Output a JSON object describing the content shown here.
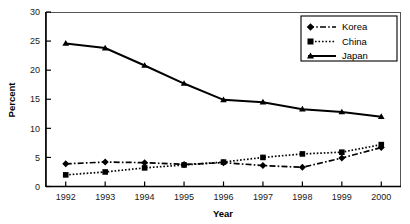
{
  "chart_data": {
    "type": "line",
    "title": "",
    "xlabel": "Year",
    "ylabel": "Percent",
    "categories": [
      1992,
      1993,
      1994,
      1995,
      1996,
      1997,
      1998,
      1999,
      2000
    ],
    "x_tick_labels": [
      "1992",
      "1993",
      "1994",
      "1995",
      "1996",
      "1997",
      "1998",
      "1999",
      "2000"
    ],
    "y_tick_labels": [
      "0",
      "5",
      "10",
      "15",
      "20",
      "25",
      "30"
    ],
    "y_ticks": [
      0,
      5,
      10,
      15,
      20,
      25,
      30
    ],
    "ylim": [
      0,
      30
    ],
    "xlim": [
      1992,
      2000
    ],
    "grid": false,
    "legend_position": "top-right",
    "series": [
      {
        "name": "Korea",
        "marker": "diamond",
        "linestyle": "dash-dot",
        "color": "#000000",
        "values": [
          3.9,
          4.2,
          4.1,
          3.8,
          4.1,
          3.6,
          3.3,
          4.9,
          6.7
        ]
      },
      {
        "name": "China",
        "marker": "square",
        "linestyle": "dotted",
        "color": "#000000",
        "values": [
          2.0,
          2.5,
          3.2,
          3.7,
          4.2,
          5.0,
          5.6,
          5.9,
          7.2
        ]
      },
      {
        "name": "Japan",
        "marker": "triangle",
        "linestyle": "solid",
        "color": "#000000",
        "values": [
          24.6,
          23.8,
          20.8,
          17.7,
          14.9,
          14.5,
          13.3,
          12.8,
          12.0
        ]
      }
    ]
  },
  "legend": {
    "entries": [
      {
        "label": "Korea"
      },
      {
        "label": "China"
      },
      {
        "label": "Japan"
      }
    ]
  }
}
